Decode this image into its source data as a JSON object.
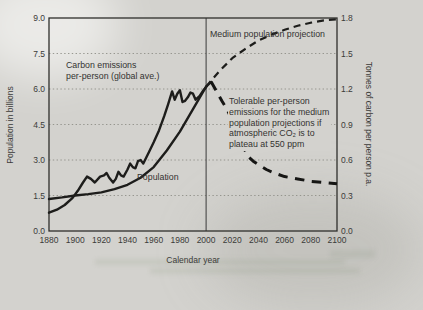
{
  "figure": {
    "xlabel": "Calendar year",
    "ylabel_left": "Population in billions",
    "ylabel_right": "Tonnes of carbon per person p.a."
  },
  "annotations": {
    "medium_projection": "Medium population projection",
    "carbon_line_1": "Carbon emissions",
    "carbon_line_2": "per-person (global ave.)",
    "tolerable_1": "Tolerable per-person",
    "tolerable_2": "emissions for the medium",
    "tolerable_3": "population projections if",
    "tolerable_4": "atmospheric CO₂ is to",
    "tolerable_5": "plateau at 550 ppm",
    "population": "Population"
  },
  "colors": {
    "page_background": "#d3d2ce",
    "line_color": "#1d1d1b",
    "grid_color": "#8f8f88",
    "text_color": "#3b3b39"
  },
  "chart_data": {
    "type": "line",
    "title": "",
    "xlabel": "Calendar year",
    "ylabel_left": "Population in billions",
    "ylabel_right": "Tonnes of carbon per person p.a.",
    "x_range": [
      1880,
      2100
    ],
    "x_ticks": [
      1880,
      1900,
      1920,
      1940,
      1960,
      1980,
      2000,
      2020,
      2040,
      2060,
      2080,
      2100
    ],
    "y_left": {
      "range": [
        0,
        9
      ],
      "ticks": [
        0,
        1.5,
        3,
        4.5,
        6,
        7.5,
        9
      ],
      "tick_labels": [
        "0.0",
        "1.5",
        "3.0",
        "4.5",
        "6.0",
        "7.5",
        "9.0"
      ],
      "grid_ticks": [
        1.5,
        3,
        4.5,
        6,
        7.5
      ]
    },
    "y_right": {
      "range": [
        0,
        1.8
      ],
      "ticks": [
        0,
        0.3,
        0.6,
        0.9,
        1.2,
        1.5,
        1.8
      ],
      "tick_labels": [
        "0.0",
        "0.3",
        "0.6",
        "0.9",
        "1.2",
        "1.5",
        "1.8"
      ]
    },
    "grid": "dotted-horizontal",
    "legend": "none (labels annotated on plot)",
    "reference_line_x": 2000,
    "series": [
      {
        "id": "population-historical",
        "name": "Population",
        "axis": "left",
        "style": "solid",
        "points": [
          [
            1880,
            1.35
          ],
          [
            1890,
            1.42
          ],
          [
            1900,
            1.5
          ],
          [
            1910,
            1.56
          ],
          [
            1920,
            1.63
          ],
          [
            1930,
            1.77
          ],
          [
            1940,
            1.95
          ],
          [
            1950,
            2.25
          ],
          [
            1960,
            2.7
          ],
          [
            1970,
            3.4
          ],
          [
            1980,
            4.2
          ],
          [
            1990,
            5.15
          ],
          [
            2000,
            6.1
          ]
        ]
      },
      {
        "id": "population-projection",
        "name": "Medium population projection",
        "axis": "left",
        "style": "dashed",
        "points": [
          [
            2000,
            6.1
          ],
          [
            2010,
            6.75
          ],
          [
            2020,
            7.3
          ],
          [
            2030,
            7.7
          ],
          [
            2040,
            8.05
          ],
          [
            2050,
            8.3
          ],
          [
            2060,
            8.5
          ],
          [
            2070,
            8.67
          ],
          [
            2080,
            8.8
          ],
          [
            2090,
            8.9
          ],
          [
            2100,
            8.95
          ]
        ]
      },
      {
        "id": "carbon-emissions-historical",
        "name": "Carbon emissions per-person (global ave.)",
        "axis": "right",
        "style": "solid",
        "points": [
          [
            1880,
            0.155
          ],
          [
            1886,
            0.18
          ],
          [
            1892,
            0.22
          ],
          [
            1898,
            0.28
          ],
          [
            1902,
            0.34
          ],
          [
            1906,
            0.41
          ],
          [
            1909,
            0.46
          ],
          [
            1912,
            0.44
          ],
          [
            1915,
            0.41
          ],
          [
            1919,
            0.46
          ],
          [
            1922,
            0.47
          ],
          [
            1924,
            0.49
          ],
          [
            1926,
            0.45
          ],
          [
            1929,
            0.41
          ],
          [
            1931,
            0.44
          ],
          [
            1933,
            0.5
          ],
          [
            1935,
            0.47
          ],
          [
            1937,
            0.46
          ],
          [
            1940,
            0.52
          ],
          [
            1942,
            0.57
          ],
          [
            1944,
            0.54
          ],
          [
            1946,
            0.53
          ],
          [
            1948,
            0.59
          ],
          [
            1950,
            0.6
          ],
          [
            1952,
            0.57
          ],
          [
            1956,
            0.66
          ],
          [
            1960,
            0.75
          ],
          [
            1964,
            0.85
          ],
          [
            1968,
            0.97
          ],
          [
            1971,
            1.07
          ],
          [
            1974,
            1.18
          ],
          [
            1976,
            1.11
          ],
          [
            1978,
            1.16
          ],
          [
            1980,
            1.19
          ],
          [
            1982,
            1.09
          ],
          [
            1984,
            1.1
          ],
          [
            1986,
            1.13
          ],
          [
            1988,
            1.17
          ],
          [
            1990,
            1.16
          ],
          [
            1992,
            1.11
          ],
          [
            1995,
            1.14
          ],
          [
            1998,
            1.19
          ],
          [
            2001,
            1.23
          ],
          [
            2004,
            1.26
          ]
        ]
      },
      {
        "id": "carbon-tolerable-projection",
        "name": "Tolerable per-person emissions for the medium population projections if atmospheric CO2 is to plateau at 550 ppm",
        "axis": "right",
        "style": "dashed-bold",
        "points": [
          [
            2004,
            1.26
          ],
          [
            2008,
            1.18
          ],
          [
            2012,
            1.1
          ],
          [
            2016,
            1.03
          ],
          [
            2020,
            0.93
          ],
          [
            2024,
            0.82
          ],
          [
            2028,
            0.72
          ],
          [
            2032,
            0.63
          ],
          [
            2036,
            0.59
          ],
          [
            2040,
            0.56
          ],
          [
            2046,
            0.52
          ],
          [
            2052,
            0.49
          ],
          [
            2060,
            0.46
          ],
          [
            2070,
            0.44
          ],
          [
            2080,
            0.42
          ],
          [
            2090,
            0.41
          ],
          [
            2100,
            0.4
          ]
        ]
      }
    ]
  }
}
